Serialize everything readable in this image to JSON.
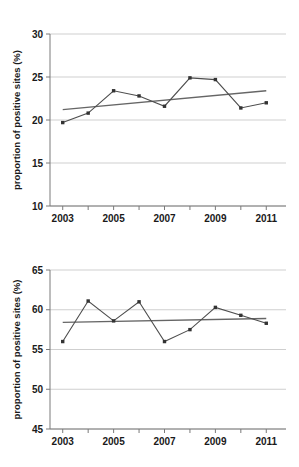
{
  "figure": {
    "background": "#ffffff",
    "series_color": "#4d4d4d",
    "marker_color": "#333333",
    "trend_color": "#666666",
    "grid_color": "#cfcfcf",
    "axis_color": "#7a7a7a",
    "text_color": "#1a1a1a"
  },
  "chart_data": [
    {
      "type": "line",
      "id": "top-chart",
      "title": "",
      "xlabel": "",
      "ylabel": "proportion of positive sites (%)",
      "x": [
        2003,
        2004,
        2005,
        2006,
        2007,
        2008,
        2009,
        2010,
        2011
      ],
      "values": [
        19.7,
        20.8,
        23.4,
        22.8,
        21.6,
        24.9,
        24.7,
        21.4,
        22.0
      ],
      "xlim": [
        2002.5,
        2011.5
      ],
      "ylim": [
        10,
        30
      ],
      "yticks": [
        10,
        15,
        20,
        25,
        30
      ],
      "ytick_labels": [
        "10",
        "15",
        "20",
        "25",
        "30"
      ],
      "xticks": [
        2003,
        2004,
        2005,
        2006,
        2007,
        2008,
        2009,
        2010,
        2011
      ],
      "xtick_labels": [
        "2003",
        "",
        "2005",
        "",
        "2007",
        "",
        "2009",
        "",
        "2011"
      ],
      "grid": true,
      "legend": "none",
      "marker": "square",
      "trendline": {
        "name": "linear trend",
        "x": [
          2003,
          2011
        ],
        "y": [
          21.2,
          23.4
        ]
      }
    },
    {
      "type": "line",
      "id": "bottom-chart",
      "title": "",
      "xlabel": "",
      "ylabel": "proportion of positive sites (%)",
      "x": [
        2003,
        2004,
        2005,
        2006,
        2007,
        2008,
        2009,
        2010,
        2011
      ],
      "values": [
        56.0,
        61.1,
        58.6,
        61.0,
        56.0,
        57.5,
        60.3,
        59.3,
        58.3
      ],
      "xlim": [
        2002.5,
        2011.5
      ],
      "ylim": [
        45,
        65
      ],
      "yticks": [
        45,
        50,
        55,
        60,
        65
      ],
      "ytick_labels": [
        "45",
        "50",
        "55",
        "60",
        "65"
      ],
      "xticks": [
        2003,
        2004,
        2005,
        2006,
        2007,
        2008,
        2009,
        2010,
        2011
      ],
      "xtick_labels": [
        "2003",
        "",
        "2005",
        "",
        "2007",
        "",
        "2009",
        "",
        "2011"
      ],
      "grid": true,
      "legend": "none",
      "marker": "square",
      "trendline": {
        "name": "linear trend",
        "x": [
          2003,
          2011
        ],
        "y": [
          58.4,
          58.9
        ]
      }
    }
  ]
}
